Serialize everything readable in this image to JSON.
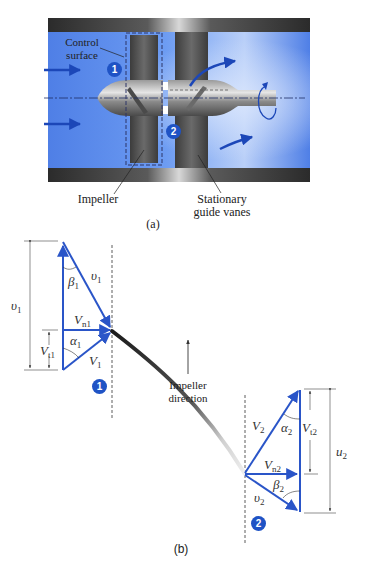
{
  "figure_a": {
    "labels": {
      "control_surface_1": "Control",
      "control_surface_2": "surface",
      "impeller": "Impeller",
      "guide_vanes_1": "Stationary",
      "guide_vanes_2": "guide vanes"
    },
    "stations": {
      "inlet": "1",
      "outlet": "2"
    },
    "caption": "(a)"
  },
  "figure_b": {
    "inlet_triangle": {
      "blade_speed": "υ",
      "blade_speed_sub": "1",
      "relative_velocity": "υ",
      "relative_velocity_sub": "1",
      "beta": "β",
      "beta_sub": "1",
      "normal_velocity": "V",
      "normal_velocity_sub": "n1",
      "alpha": "α",
      "alpha_sub": "1",
      "tangential_velocity": "V",
      "tangential_velocity_sub": "t1",
      "absolute_velocity": "V",
      "absolute_velocity_sub": "1"
    },
    "outlet_triangle": {
      "absolute_velocity": "V",
      "absolute_velocity_sub": "2",
      "alpha": "α",
      "alpha_sub": "2",
      "tangential_velocity": "V",
      "tangential_velocity_sub": "t2",
      "blade_speed": "u",
      "blade_speed_sub": "2",
      "normal_velocity": "V",
      "normal_velocity_sub": "n2",
      "beta": "β",
      "beta_sub": "2",
      "relative_velocity": "υ",
      "relative_velocity_sub": "2"
    },
    "impeller_direction_1": "Impeller",
    "impeller_direction_2": "direction",
    "stations": {
      "inlet": "1",
      "outlet": "2"
    },
    "caption": "(b)"
  },
  "colors": {
    "vector_blue": "#2a55c8",
    "badge_blue": "#1f53c5",
    "fluid_blue": "#5b8ef0",
    "housing_dark": "#3a3a3a"
  }
}
